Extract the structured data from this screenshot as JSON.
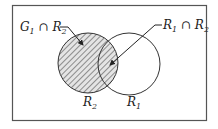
{
  "diagram": {
    "type": "venn",
    "sets": [
      {
        "name": "R2",
        "base": "R",
        "sub": "2",
        "hatched": true
      },
      {
        "name": "R1",
        "base": "R",
        "sub": "1",
        "hatched": false
      }
    ],
    "callouts": [
      {
        "label": "G1 ∩ R2",
        "target": "hatched region of R2 outside R1"
      },
      {
        "label": "R1 ∩ R2",
        "target": "overlap of R1 and R2"
      }
    ]
  },
  "labels": {
    "g1_r2": {
      "a": "G",
      "a_sub": "1",
      "op": " ∩ ",
      "b": "R",
      "b_sub": "2"
    },
    "r1_r2": {
      "a": "R",
      "a_sub": "1",
      "op": " ∩ ",
      "b": "R",
      "b_sub": "2"
    },
    "r2": {
      "base": "R",
      "sub": "2"
    },
    "r1": {
      "base": "R",
      "sub": "1"
    }
  },
  "colors": {
    "line": "#333333",
    "hatch": "#555555",
    "fill": "#dcdcdc",
    "frame": "#555555"
  }
}
